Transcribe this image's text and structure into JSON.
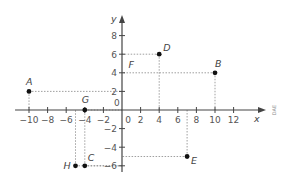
{
  "diagram": {
    "type": "coordinate-plane",
    "axes": {
      "x_label": "x",
      "y_label": "y",
      "origin_label": "0",
      "x_ticks": [
        -10,
        -8,
        -6,
        -4,
        -2,
        0,
        2,
        4,
        6,
        8,
        10,
        12
      ],
      "x_tick_labels": [
        "−10",
        "−8",
        "−6",
        "−4",
        "−2",
        "0",
        "2",
        "4",
        "6",
        "8",
        "10",
        "12"
      ],
      "y_ticks": [
        8,
        6,
        4,
        2,
        -2,
        -4,
        -6
      ],
      "y_tick_labels": [
        "8",
        "6",
        "4",
        "2",
        "−2",
        "−4",
        "−6"
      ],
      "x_range": [
        -11.5,
        13.5
      ],
      "y_range": [
        -6.5,
        10
      ]
    },
    "points": [
      {
        "label": "A",
        "x": -10,
        "y": 2
      },
      {
        "label": "B",
        "x": 10,
        "y": 4
      },
      {
        "label": "C",
        "x": -4,
        "y": -6
      },
      {
        "label": "D",
        "x": 4,
        "y": 6
      },
      {
        "label": "E",
        "x": 7,
        "y": -5
      },
      {
        "label": "G",
        "x": -4,
        "y": 0
      },
      {
        "label": "H",
        "x": -5,
        "y": -6
      }
    ],
    "annotations": [
      {
        "label": "F",
        "x": 0.6,
        "y": 4.8
      }
    ],
    "credit": "DAE",
    "colors": {
      "axis": "#444444",
      "point": "#111111",
      "guide": "#888888",
      "text": "#555555"
    }
  }
}
